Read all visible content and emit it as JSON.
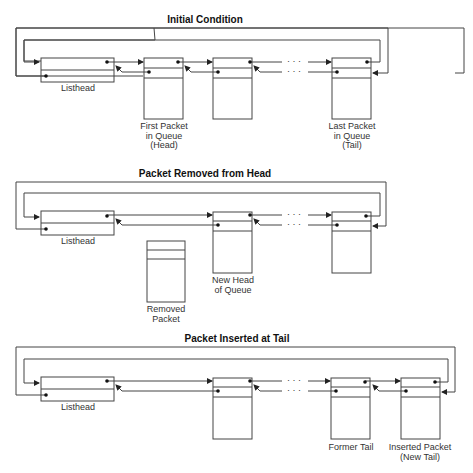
{
  "panels": [
    {
      "title": "Initial Condition",
      "labels": {
        "listhead": "Listhead",
        "first": "First Packet\nin Queue\n(Head)",
        "last": "Last Packet\nin Queue\n(Tail)"
      }
    },
    {
      "title": "Packet Removed from Head",
      "labels": {
        "listhead": "Listhead",
        "removed": "Removed\nPacket",
        "new_head": "New Head\nof Queue"
      }
    },
    {
      "title": "Packet Inserted at Tail",
      "labels": {
        "listhead": "Listhead",
        "former_tail": "Former Tail",
        "inserted": "Inserted Packet\n(New Tail)"
      }
    }
  ],
  "ellipsis": "· · ·",
  "colors": {
    "line": "#444444",
    "dot": "#111111"
  }
}
